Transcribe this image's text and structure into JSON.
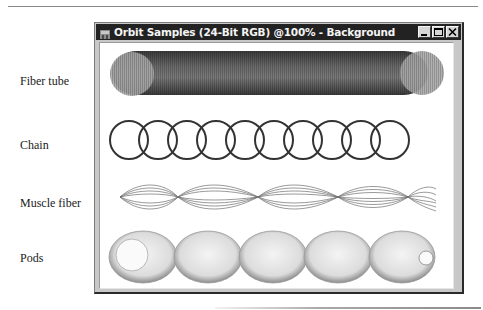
{
  "window": {
    "title": "Orbit Samples (24-Bit RGB) @100% - Background",
    "buttons": [
      "minimize",
      "maximize",
      "close"
    ]
  },
  "labels": [
    {
      "id": "fiber-tube",
      "text": "Fiber tube"
    },
    {
      "id": "chain",
      "text": "Chain"
    },
    {
      "id": "muscle-fiber",
      "text": "Muscle fiber"
    },
    {
      "id": "pods",
      "text": "Pods"
    }
  ],
  "samples": {
    "fiber_tube": {
      "type": "tube",
      "color": "#6e6e6e"
    },
    "chain": {
      "type": "rings",
      "count": 10,
      "stroke": "#333333"
    },
    "muscle_fiber": {
      "type": "twisted-strands",
      "bulges": 3
    },
    "pods": {
      "type": "linked-spheres",
      "count": 5
    }
  },
  "colors": {
    "titlebar": "#222222",
    "frame": "#c8c8c8",
    "canvas": "#ffffff"
  }
}
